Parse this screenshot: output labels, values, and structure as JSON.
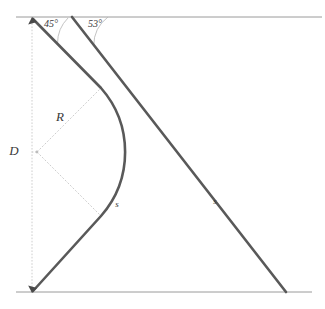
{
  "figure": {
    "background_color": "#ffffff",
    "line_color": "#595959",
    "guide_color": "#c2c2c2",
    "frame_color": "#9a9a9a",
    "width": 325,
    "height": 309
  },
  "labels": {
    "angle_left": "45°",
    "angle_right": "53°",
    "diameter": "D",
    "radius": "R",
    "arc_length": "s",
    "straight_length": "s"
  },
  "geometry": {
    "top_line_y": 17,
    "bottom_line_y": 292,
    "top_line_x1": 16,
    "top_line_x2": 322,
    "bottom_line_x1": 16,
    "bottom_line_x2": 312,
    "apex_x": 32,
    "apex_y": 18,
    "base_x": 32,
    "base_y": 292,
    "second_line_start_x": 72,
    "second_line_start_y": 17,
    "second_line_end_x": 286,
    "second_line_end_y": 292,
    "arc_center_x": 37,
    "arc_center_y": 152,
    "arc_radius": 97,
    "arc_apex_x": 134,
    "arc_apex_y": 152,
    "tangent_upper_x": 101,
    "tangent_upper_y": 88,
    "tangent_lower_x": 101,
    "tangent_lower_y": 216,
    "vertical_dotted_x": 32,
    "angle_left_value": 45,
    "angle_right_value": 53
  },
  "label_positions": {
    "angle_left_x": 44,
    "angle_left_y": 27,
    "angle_right_x": 88,
    "angle_right_y": 27,
    "diameter_x": 14,
    "diameter_y": 154,
    "radius_x": 60,
    "radius_y": 118,
    "arc_s_x": 117,
    "arc_s_y": 206,
    "line_s_x": 215,
    "line_s_y": 203
  }
}
